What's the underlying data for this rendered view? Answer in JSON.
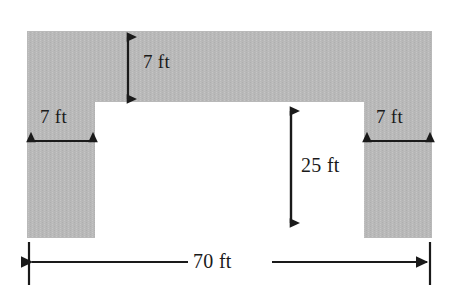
{
  "figure": {
    "type": "dimensioned-u-shape",
    "shape_name": "u-shape-region",
    "fill_color": "#b8b8b8",
    "line_color": "#1a1a1a",
    "background_color": "#ffffff",
    "units": "ft"
  },
  "dimensions": {
    "top_thickness": {
      "value": 7,
      "label": "7 ft",
      "orientation": "vertical",
      "name": "top-band-thickness"
    },
    "left_leg_width": {
      "value": 7,
      "label": "7 ft",
      "orientation": "horizontal",
      "name": "left-leg-width"
    },
    "right_leg_width": {
      "value": 7,
      "label": "7 ft",
      "orientation": "horizontal",
      "name": "right-leg-width"
    },
    "notch_height": {
      "value": 25,
      "label": "25 ft",
      "orientation": "vertical",
      "name": "inner-notch-height"
    },
    "overall_width": {
      "value": 70,
      "label": "70 ft",
      "orientation": "horizontal",
      "name": "overall-width"
    }
  }
}
